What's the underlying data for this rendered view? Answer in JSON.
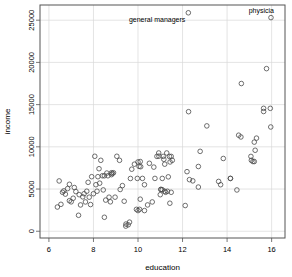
{
  "figure": {
    "background": "#ffffff",
    "frame_color": "#555555",
    "grid_color": "#d8d8d8",
    "marker_color": "#4a4a4a"
  },
  "chart_data": {
    "type": "scatter",
    "title": "",
    "xlabel": "education",
    "ylabel": "income",
    "xlim": [
      5.6,
      16.6
    ],
    "ylim": [
      -800,
      26800
    ],
    "xticks": [
      6,
      8,
      10,
      12,
      14,
      16
    ],
    "xticklabels": [
      "6",
      "8",
      "10",
      "12",
      "14",
      "16"
    ],
    "yticks": [
      0,
      5000,
      10000,
      15000,
      20000,
      25000
    ],
    "yticklabels": [
      "0",
      "5000",
      "10000",
      "15000",
      "20000",
      "25000"
    ],
    "grid": true,
    "marker": "open-circle",
    "marker_size": 2.3,
    "points": [
      [
        6.38,
        2870
      ],
      [
        6.46,
        5959
      ],
      [
        6.54,
        3190
      ],
      [
        6.61,
        4615
      ],
      [
        6.67,
        4780
      ],
      [
        6.74,
        4398
      ],
      [
        6.84,
        5052
      ],
      [
        6.92,
        5562
      ],
      [
        6.92,
        3617
      ],
      [
        7.0,
        3485
      ],
      [
        7.09,
        3911
      ],
      [
        7.14,
        5180
      ],
      [
        7.21,
        4696
      ],
      [
        7.33,
        1890
      ],
      [
        7.36,
        4330
      ],
      [
        7.42,
        3116
      ],
      [
        7.52,
        4075
      ],
      [
        7.58,
        4444
      ],
      [
        7.64,
        3472
      ],
      [
        7.7,
        4741
      ],
      [
        7.76,
        5795
      ],
      [
        7.81,
        4036
      ],
      [
        7.87,
        3161
      ],
      [
        7.92,
        6462
      ],
      [
        8.0,
        4444
      ],
      [
        8.06,
        8880
      ],
      [
        8.11,
        5511
      ],
      [
        8.16,
        4741
      ],
      [
        8.2,
        6462
      ],
      [
        8.25,
        7405
      ],
      [
        8.28,
        5695
      ],
      [
        8.33,
        8403
      ],
      [
        8.4,
        6573
      ],
      [
        8.44,
        4895
      ],
      [
        8.49,
        6573
      ],
      [
        8.49,
        1656
      ],
      [
        8.55,
        3691
      ],
      [
        8.6,
        6893
      ],
      [
        8.65,
        6573
      ],
      [
        8.7,
        4034
      ],
      [
        8.76,
        3485
      ],
      [
        8.81,
        6928
      ],
      [
        8.81,
        6707
      ],
      [
        8.85,
        6850
      ],
      [
        8.9,
        6928
      ],
      [
        8.97,
        4036
      ],
      [
        9.05,
        8880
      ],
      [
        9.17,
        8403
      ],
      [
        9.2,
        4946
      ],
      [
        9.3,
        5407
      ],
      [
        9.38,
        3554
      ],
      [
        9.45,
        611
      ],
      [
        9.46,
        853
      ],
      [
        9.56,
        766
      ],
      [
        9.62,
        1080
      ],
      [
        9.66,
        6250
      ],
      [
        9.72,
        7350
      ],
      [
        9.84,
        7944
      ],
      [
        9.93,
        2594
      ],
      [
        9.97,
        6259
      ],
      [
        10.0,
        8206
      ],
      [
        10.0,
        2448
      ],
      [
        10.05,
        7682
      ],
      [
        10.07,
        2594
      ],
      [
        10.1,
        8258
      ],
      [
        10.1,
        3800
      ],
      [
        10.12,
        7647
      ],
      [
        10.2,
        6259
      ],
      [
        10.29,
        5511
      ],
      [
        10.29,
        2448
      ],
      [
        10.43,
        3116
      ],
      [
        10.51,
        8049
      ],
      [
        10.64,
        3472
      ],
      [
        10.71,
        7597
      ],
      [
        10.76,
        6259
      ],
      [
        10.85,
        8865
      ],
      [
        10.93,
        9271
      ],
      [
        10.94,
        8895
      ],
      [
        11.0,
        4330
      ],
      [
        11.03,
        4956
      ],
      [
        11.03,
        4949
      ],
      [
        11.09,
        4914
      ],
      [
        11.09,
        6259
      ],
      [
        11.13,
        8865
      ],
      [
        11.16,
        8522
      ],
      [
        11.2,
        7947
      ],
      [
        11.2,
        4736
      ],
      [
        11.24,
        4614
      ],
      [
        11.29,
        9271
      ],
      [
        11.32,
        4736
      ],
      [
        11.36,
        6443
      ],
      [
        11.41,
        8865
      ],
      [
        11.43,
        3320
      ],
      [
        11.44,
        8206
      ],
      [
        11.49,
        8865
      ],
      [
        11.49,
        4614
      ],
      [
        11.54,
        8403
      ],
      [
        12.12,
        3046
      ],
      [
        12.2,
        7059
      ],
      [
        12.26,
        25879
      ],
      [
        12.27,
        14163
      ],
      [
        12.31,
        6112
      ],
      [
        12.46,
        5969
      ],
      [
        12.71,
        5234
      ],
      [
        12.71,
        7670
      ],
      [
        12.79,
        9463
      ],
      [
        13.09,
        12480
      ],
      [
        13.62,
        5902
      ],
      [
        13.71,
        5511
      ],
      [
        13.83,
        8619
      ],
      [
        14.15,
        6259
      ],
      [
        14.15,
        6259
      ],
      [
        14.44,
        4890
      ],
      [
        14.52,
        11377
      ],
      [
        14.62,
        11169
      ],
      [
        14.64,
        17498
      ],
      [
        15.07,
        8865
      ],
      [
        15.09,
        8403
      ],
      [
        15.16,
        8258
      ],
      [
        15.22,
        8258
      ],
      [
        15.22,
        10559
      ],
      [
        15.26,
        9593
      ],
      [
        15.32,
        11030
      ],
      [
        15.64,
        14558
      ],
      [
        15.64,
        14185
      ],
      [
        15.77,
        19263
      ],
      [
        15.94,
        14558
      ],
      [
        15.96,
        12351
      ],
      [
        15.97,
        25308
      ]
    ],
    "annotations": [
      {
        "label": "general managers",
        "x": 12.26,
        "y": 25879,
        "label_position": "below-left",
        "truncated": false
      },
      {
        "label": "physicia",
        "x": 15.97,
        "y": 25308,
        "label_position": "above-left",
        "truncated": true
      }
    ]
  }
}
